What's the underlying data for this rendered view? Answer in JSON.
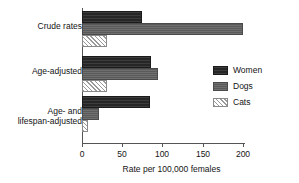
{
  "chart_data": {
    "type": "bar",
    "orientation": "horizontal",
    "title": "",
    "xlabel": "Rate per 100,000 females",
    "ylabel": "",
    "categories": [
      "Crude rates",
      "Age-adjusted",
      "Age- and\nlifespan-adjusted"
    ],
    "series": [
      {
        "name": "Women",
        "color": "#262626",
        "pattern": "solid-dark",
        "values": [
          75,
          86,
          85
        ]
      },
      {
        "name": "Dogs",
        "color": "#5a5a5a",
        "pattern": "solid-gray",
        "values": [
          200,
          95,
          21
        ]
      },
      {
        "name": "Cats",
        "color": "#ffffff",
        "pattern": "hatched",
        "values": [
          31,
          31,
          8
        ]
      }
    ],
    "xlim": [
      0,
      200
    ],
    "xticks": [
      0,
      50,
      100,
      150,
      200
    ],
    "xtick_labels": [
      "0",
      "50",
      "100",
      "150",
      "200"
    ],
    "grid": false,
    "legend_position": "center-right",
    "legend_entries": [
      "Women",
      "Dogs",
      "Cats"
    ]
  },
  "axis": {
    "x_title": "Rate per 100,000 females"
  }
}
